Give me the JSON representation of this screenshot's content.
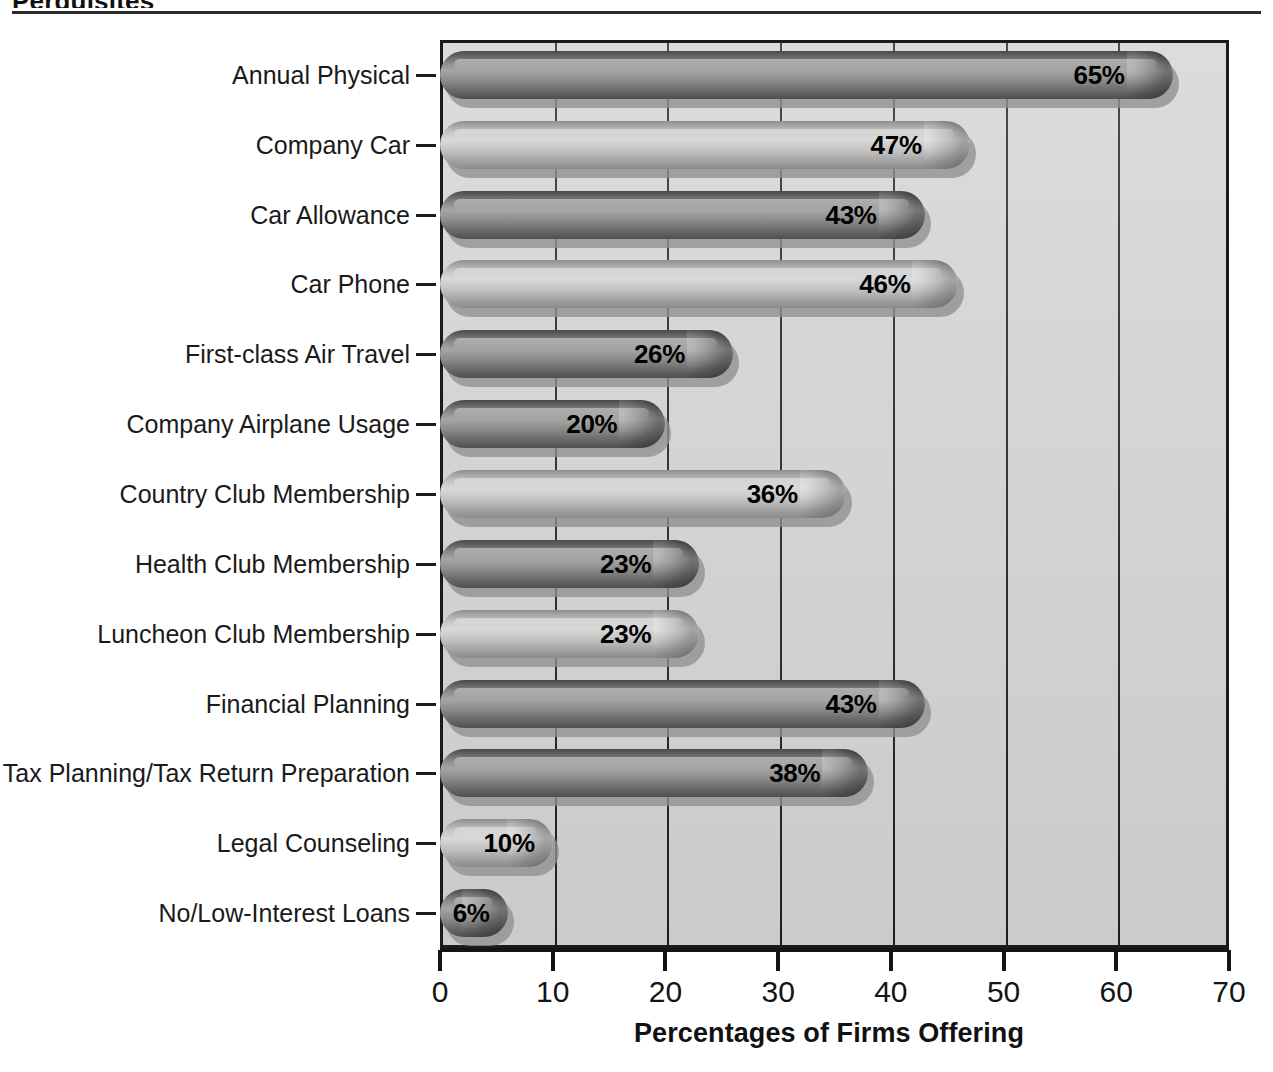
{
  "page": {
    "title_fragment": "Perquisites",
    "background_color": "#ffffff",
    "rule_color": "#2b2b2b"
  },
  "chart_data": {
    "type": "bar",
    "orientation": "horizontal",
    "title": "",
    "xlabel": "Percentages of Firms Offering",
    "ylabel": "",
    "xlim": [
      0,
      70
    ],
    "xticks": [
      0,
      10,
      20,
      30,
      40,
      50,
      60,
      70
    ],
    "xtick_labels": [
      "0",
      "10",
      "20",
      "30",
      "40",
      "50",
      "60",
      "70"
    ],
    "grid": "vertical",
    "legend": "none",
    "value_suffix": "%",
    "plot_background_color": "#d3d3d1",
    "bar_dark_color": "#6f6f6f",
    "bar_light_color": "#bdbdbd",
    "categories": [
      "Annual Physical",
      "Company Car",
      "Car Allowance",
      "Car Phone",
      "First-class Air Travel",
      "Company Airplane Usage",
      "Country Club Membership",
      "Health Club Membership",
      "Luncheon Club Membership",
      "Financial Planning",
      "Tax Planning/Tax Return Preparation",
      "Legal Counseling",
      "No/Low-Interest Loans"
    ],
    "values": [
      65,
      47,
      43,
      46,
      26,
      20,
      36,
      23,
      23,
      43,
      38,
      10,
      6
    ],
    "value_labels": [
      "65%",
      "47%",
      "43%",
      "46%",
      "26%",
      "20%",
      "36%",
      "23%",
      "23%",
      "43%",
      "38%",
      "10%",
      "6%"
    ],
    "bar_shades": [
      "dark",
      "light",
      "dark",
      "light",
      "dark",
      "dark",
      "light",
      "dark",
      "light",
      "dark",
      "dark",
      "light",
      "dark"
    ]
  }
}
